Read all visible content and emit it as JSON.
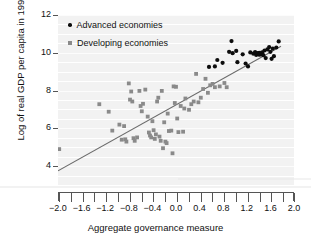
{
  "chart_data": {
    "type": "scatter",
    "title": "",
    "xlabel": "Aggregate governance measure",
    "ylabel": "Log of real GDP per capita in 1995",
    "xlim": [
      -2.0,
      2.0
    ],
    "ylim": [
      3.0,
      12.0
    ],
    "grid": true,
    "x_major_step": 0.4,
    "x_minor_step": 0.2,
    "y_major_step": 2,
    "y_gridline_step": 0.5,
    "xticklabels": [
      "-2.0",
      "-1.6",
      "-1.2",
      "-0.8",
      "-0.4",
      "0.0",
      "0.4",
      "0.8",
      "1.2",
      "1.6",
      "2.0"
    ],
    "xtickvalues": [
      -2.0,
      -1.6,
      -1.2,
      -0.8,
      -0.4,
      0.0,
      0.4,
      0.8,
      1.2,
      1.6,
      2.0
    ],
    "yticklabels": [
      "4",
      "6",
      "8",
      "10",
      "12"
    ],
    "ytickvalues": [
      4,
      6,
      8,
      10,
      12
    ],
    "legend_position": "top-left",
    "colors": {
      "advanced": "#0d0d0d",
      "developing": "#8a8a8a",
      "trendline": "#6b6b6b",
      "plot_background": "#f2f2f2",
      "gridline": "#ffffff",
      "axis": "#555555",
      "text": "#111111"
    },
    "trendline": {
      "label": "fitted regression line",
      "x_start": -2.0,
      "y_start": 3.75,
      "x_end": 1.78,
      "y_end": 10.35
    },
    "series": [
      {
        "name": "Advanced economies",
        "marker": "circle",
        "color": "#0d0d0d",
        "points": [
          [
            0.56,
            9.25
          ],
          [
            0.66,
            9.28
          ],
          [
            0.7,
            9.62
          ],
          [
            0.79,
            9.47
          ],
          [
            0.9,
            10.05
          ],
          [
            0.94,
            10.62
          ],
          [
            0.96,
            9.98
          ],
          [
            1.02,
            10.1
          ],
          [
            1.04,
            9.5
          ],
          [
            1.13,
            9.92
          ],
          [
            1.18,
            9.43
          ],
          [
            1.22,
            9.28
          ],
          [
            1.26,
            10.02
          ],
          [
            1.31,
            9.95
          ],
          [
            1.34,
            10.04
          ],
          [
            1.36,
            9.88
          ],
          [
            1.38,
            9.98
          ],
          [
            1.4,
            9.92
          ],
          [
            1.41,
            10.0
          ],
          [
            1.42,
            9.9
          ],
          [
            1.43,
            9.96
          ],
          [
            1.45,
            9.93
          ],
          [
            1.46,
            10.02
          ],
          [
            1.48,
            9.87
          ],
          [
            1.5,
            10.12
          ],
          [
            1.52,
            9.72
          ],
          [
            1.55,
            10.18
          ],
          [
            1.58,
            10.3
          ],
          [
            1.6,
            10.05
          ],
          [
            1.62,
            9.68
          ],
          [
            1.64,
            10.22
          ],
          [
            1.66,
            9.82
          ],
          [
            1.7,
            10.28
          ],
          [
            1.74,
            10.6
          ]
        ]
      },
      {
        "name": "Developing economies",
        "marker": "square",
        "color": "#8a8a8a",
        "points": [
          [
            -1.98,
            4.9
          ],
          [
            -1.3,
            7.28
          ],
          [
            -1.14,
            6.88
          ],
          [
            -1.08,
            5.88
          ],
          [
            -0.96,
            6.2
          ],
          [
            -0.92,
            5.4
          ],
          [
            -0.88,
            6.12
          ],
          [
            -0.86,
            5.42
          ],
          [
            -0.84,
            5.3
          ],
          [
            -0.8,
            8.38
          ],
          [
            -0.78,
            7.52
          ],
          [
            -0.76,
            7.95
          ],
          [
            -0.74,
            7.42
          ],
          [
            -0.72,
            5.48
          ],
          [
            -0.7,
            5.34
          ],
          [
            -0.66,
            5.52
          ],
          [
            -0.62,
            7.98
          ],
          [
            -0.6,
            7.18
          ],
          [
            -0.58,
            6.9
          ],
          [
            -0.56,
            7.3
          ],
          [
            -0.52,
            8.05
          ],
          [
            -0.48,
            6.62
          ],
          [
            -0.46,
            5.78
          ],
          [
            -0.44,
            5.62
          ],
          [
            -0.42,
            5.52
          ],
          [
            -0.4,
            6.38
          ],
          [
            -0.38,
            5.9
          ],
          [
            -0.36,
            5.44
          ],
          [
            -0.34,
            5.68
          ],
          [
            -0.32,
            7.42
          ],
          [
            -0.3,
            7.62
          ],
          [
            -0.28,
            5.56
          ],
          [
            -0.26,
            5.34
          ],
          [
            -0.24,
            7.98
          ],
          [
            -0.22,
            4.95
          ],
          [
            -0.2,
            6.32
          ],
          [
            -0.18,
            5.3
          ],
          [
            -0.16,
            5.22
          ],
          [
            -0.14,
            6.78
          ],
          [
            -0.12,
            5.86
          ],
          [
            -0.08,
            5.88
          ],
          [
            -0.06,
            4.68
          ],
          [
            -0.04,
            8.22
          ],
          [
            -0.02,
            7.34
          ],
          [
            0.0,
            8.2
          ],
          [
            0.02,
            6.52
          ],
          [
            0.04,
            5.8
          ],
          [
            0.08,
            7.18
          ],
          [
            0.12,
            5.82
          ],
          [
            0.14,
            7.05
          ],
          [
            0.16,
            7.58
          ],
          [
            0.22,
            6.98
          ],
          [
            0.26,
            7.28
          ],
          [
            0.3,
            7.42
          ],
          [
            0.34,
            8.88
          ],
          [
            0.38,
            7.38
          ],
          [
            0.42,
            7.62
          ],
          [
            0.46,
            8.08
          ],
          [
            0.5,
            8.62
          ],
          [
            0.54,
            7.88
          ],
          [
            0.58,
            8.28
          ],
          [
            0.62,
            8.35
          ],
          [
            0.66,
            8.18
          ],
          [
            0.74,
            8.22
          ],
          [
            0.82,
            8.4
          ],
          [
            0.86,
            8.18
          ]
        ]
      }
    ]
  },
  "legend": {
    "items": [
      {
        "label": "Advanced economies",
        "marker": "circle",
        "color": "#0d0d0d"
      },
      {
        "label": "Developing economies",
        "marker": "square",
        "color": "#8a8a8a"
      }
    ]
  }
}
